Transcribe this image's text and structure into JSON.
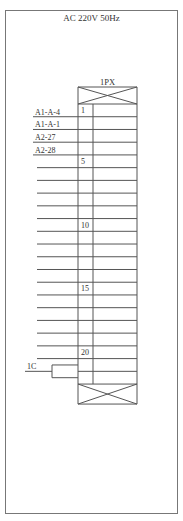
{
  "title": "AC 220V 50Hz",
  "terminal_block": {
    "name": "1PX",
    "rows_total": 22,
    "row_numbers_shown": [
      {
        "row": 1,
        "label": "1"
      },
      {
        "row": 5,
        "label": "5"
      },
      {
        "row": 10,
        "label": "10"
      },
      {
        "row": 15,
        "label": "15"
      },
      {
        "row": 20,
        "label": "20"
      }
    ]
  },
  "wires": [
    {
      "row": 1,
      "label": "A1-A-4"
    },
    {
      "row": 2,
      "label": "A1-A-1"
    },
    {
      "row": 3,
      "label": "A2-27"
    },
    {
      "row": 4,
      "label": "A2-28"
    }
  ],
  "unlabeled_wire_rows": [
    5,
    6,
    7,
    8,
    9,
    10,
    11,
    12,
    13,
    14,
    15,
    16,
    17,
    18,
    19,
    20
  ],
  "jumper": {
    "label": "1C",
    "rows": [
      21,
      22
    ]
  },
  "colors": {
    "line": "#555555",
    "frame": "#777777",
    "text": "#333333"
  }
}
